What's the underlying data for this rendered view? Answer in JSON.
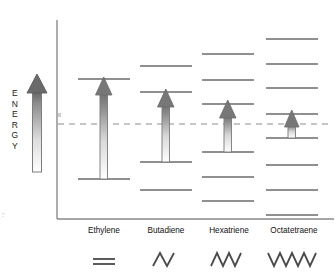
{
  "figure": {
    "title": "",
    "axis_label_text": "ENERGY",
    "axis_label_letters": [
      "E",
      "N",
      "E",
      "R",
      "G",
      "Y"
    ],
    "background_color": "#ffffff",
    "axis_color": "#8a8a8a",
    "level_color": "#6b6b6b",
    "arrow_outline_color": "#7a7a7a",
    "arrow_fill_top": "#6e6e6e",
    "arrow_fill_bottom": "#ffffff",
    "dashed_line_color": "#8e8e8e",
    "structure_color": "#4a4a4a",
    "text_color": "#111111"
  },
  "chart_data": {
    "type": "diagram",
    "subtype": "molecular-orbital-energy-level-diagram",
    "title": "Energy",
    "xlabel": "",
    "ylabel": "ENERGY",
    "grid": false,
    "legend": "none",
    "axis_ranges": {
      "y_axis_shown": true,
      "y_tick_labels": [],
      "x_axis_shown": true,
      "x_tick_labels": [
        "Ethylene",
        "Butadiene",
        "Hexatriene",
        "Octatetraene"
      ]
    },
    "annotations": [
      {
        "name": "homo-lumo-reference-line",
        "style": "dashed-horizontal",
        "y_px": 124,
        "label": ""
      }
    ],
    "categories": [
      "Ethylene",
      "Butadiene",
      "Hexatriene",
      "Octatetraene"
    ],
    "series": [
      {
        "name": "pi orbital energy levels (count)",
        "values": [
          2,
          4,
          6,
          8
        ]
      },
      {
        "name": "HOMO-LUMO gap (relative, arrow length px)",
        "values": [
          100,
          62,
          42,
          24
        ]
      }
    ],
    "columns": [
      {
        "label": "Ethylene",
        "structure": "=",
        "structure_kind": "double-bond",
        "center_x": 104,
        "level_half_width": 26,
        "levels_y": [
          79,
          179
        ],
        "homo_y": 179,
        "lumo_y": 79,
        "arrow_from_y": 179,
        "arrow_to_y": 79
      },
      {
        "label": "Butadiene",
        "structure": "zigzag-3",
        "structure_kind": "zigzag",
        "structure_segments": 3,
        "center_x": 166,
        "level_half_width": 26,
        "levels_y": [
          66,
          92,
          162,
          190
        ],
        "homo_y": 162,
        "lumo_y": 92,
        "arrow_from_y": 162,
        "arrow_to_y": 92
      },
      {
        "label": "Hexatriene",
        "structure": "zigzag-5",
        "structure_kind": "zigzag",
        "structure_segments": 5,
        "center_x": 228,
        "level_half_width": 26,
        "levels_y": [
          54,
          80,
          104,
          152,
          177,
          201
        ],
        "homo_y": 152,
        "lumo_y": 104,
        "arrow_from_y": 152,
        "arrow_to_y": 104
      },
      {
        "label": "Octatetraene",
        "structure": "zigzag-7",
        "structure_kind": "zigzag",
        "structure_segments": 7,
        "center_x": 292,
        "level_half_width": 26,
        "levels_y": [
          39,
          64,
          88,
          114,
          138,
          165,
          190,
          215
        ],
        "homo_y": 138,
        "lumo_y": 114,
        "arrow_from_y": 138,
        "arrow_to_y": 114
      }
    ],
    "energy_arrow": {
      "name": "energy-direction-arrow",
      "x": 37,
      "tail_y": 172,
      "head_y": 76,
      "direction": "up"
    }
  },
  "labels": {
    "columns": [
      {
        "text": "Ethylene",
        "x": 104,
        "y": 231
      },
      {
        "text": "Butadiene",
        "x": 166,
        "y": 231
      },
      {
        "text": "Hexatriene",
        "x": 228,
        "y": 231
      },
      {
        "text": "Octatetraene",
        "x": 292,
        "y": 231
      }
    ]
  }
}
